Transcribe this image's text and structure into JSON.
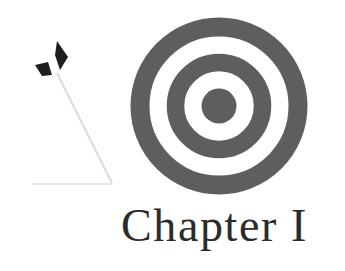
{
  "heading": {
    "chapter_label": "Chapter I"
  },
  "illustration": {
    "target_icon": "target-bullseye-icon",
    "arrow_icon": "arrow-icon",
    "colors": {
      "target": "#5e5e5e",
      "fletching": "#1e1e1e",
      "shaft": "#d8d8d8",
      "text": "#2b2b2b",
      "background": "#ffffff"
    }
  }
}
